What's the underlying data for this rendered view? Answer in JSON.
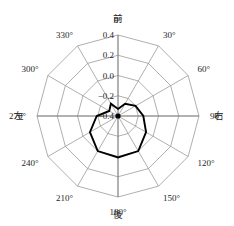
{
  "chart_data": {
    "type": "line",
    "title": "",
    "subtitle": "",
    "xlabel": "",
    "ylabel": "",
    "projection": "polar",
    "grid": true,
    "legend": null,
    "angle_unit": "degrees",
    "angle_direction": "clockwise",
    "angle_zero_at": "top",
    "categories": [
      "0°",
      "30°",
      "60°",
      "90°",
      "120°",
      "150°",
      "180°",
      "210°",
      "240°",
      "270°",
      "300°",
      "330°"
    ],
    "angles": [
      0,
      30,
      60,
      90,
      120,
      150,
      180,
      210,
      240,
      270,
      300,
      330
    ],
    "rlim": [
      -0.4,
      0.4
    ],
    "rticks": [
      -0.4,
      -0.2,
      0.0,
      0.2,
      0.4
    ],
    "rtick_labels": [
      "−0.4",
      "−0.2",
      "0.0",
      "0.2",
      "0.4"
    ],
    "series": [
      {
        "name": "",
        "values": [
          -0.33,
          -0.26,
          -0.2,
          -0.15,
          -0.08,
          0.0,
          0.01,
          0.0,
          -0.08,
          -0.19,
          -0.3,
          -0.26
        ]
      }
    ],
    "annotations": [
      {
        "text": "前",
        "angle": 0,
        "position": "outer-top"
      },
      {
        "text": "後",
        "angle": 180,
        "position": "outer-bottom"
      },
      {
        "text": "左",
        "angle": 270,
        "position": "outer-left"
      },
      {
        "text": "右",
        "angle": 90,
        "position": "outer-right"
      }
    ]
  },
  "labels": {
    "angular": {
      "a0": "0°",
      "a30": "30°",
      "a60": "60°",
      "a90": "90°",
      "a120": "120°",
      "a150": "150°",
      "a180": "180°",
      "a210": "210°",
      "a240": "240°",
      "a270": "270°",
      "a300": "300°",
      "a330": "330°"
    },
    "radial": {
      "r0": "0.4",
      "r1": "0.2",
      "r2": "0.0",
      "r3": "−0.2",
      "r4": "−0.4"
    },
    "direction": {
      "front": "前",
      "rear": "後",
      "left": "左",
      "right": "右"
    }
  },
  "colors": {
    "background": "#ffffff",
    "grid": "#8c8c8c",
    "data_stroke": "#000000",
    "text": "#262626"
  }
}
